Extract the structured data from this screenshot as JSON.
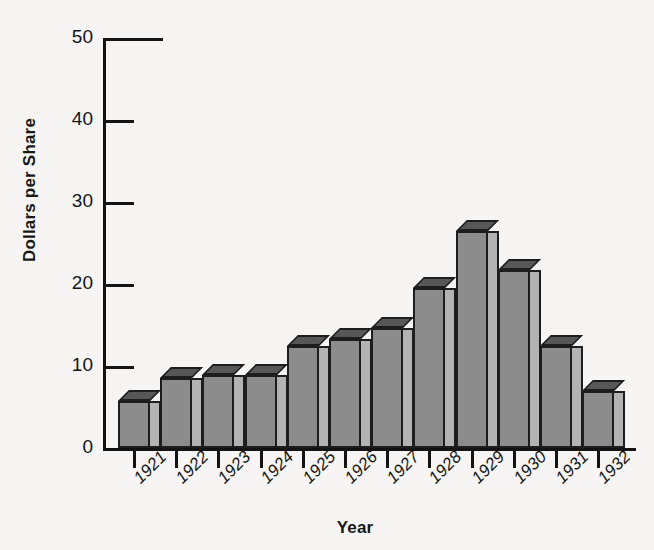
{
  "chart_data": {
    "type": "bar",
    "title": "",
    "xlabel": "Year",
    "ylabel": "Dollars per Share",
    "categories": [
      "1921",
      "1922",
      "1923",
      "1924",
      "1925",
      "1926",
      "1927",
      "1928",
      "1929",
      "1930",
      "1931",
      "1932"
    ],
    "values": [
      5.7,
      8.5,
      8.9,
      8.9,
      12.4,
      13.3,
      14.6,
      19.5,
      26.5,
      21.7,
      12.5,
      6.9
    ],
    "ylim": [
      0,
      50
    ],
    "y_ticks": [
      0,
      10,
      20,
      30,
      40,
      50
    ],
    "y_tick_labels": [
      "0",
      "10",
      "20",
      "30",
      "40",
      "50"
    ],
    "grid": false,
    "legend": null,
    "style": "3d-bars",
    "colors": {
      "bar_front": "#8c8c8c",
      "bar_top": "#575757",
      "bar_side": "#b3b3b3",
      "bar_outline": "#1d1d1d",
      "axis": "#141414",
      "background": "#f6f5f3",
      "text": "#141414"
    }
  }
}
